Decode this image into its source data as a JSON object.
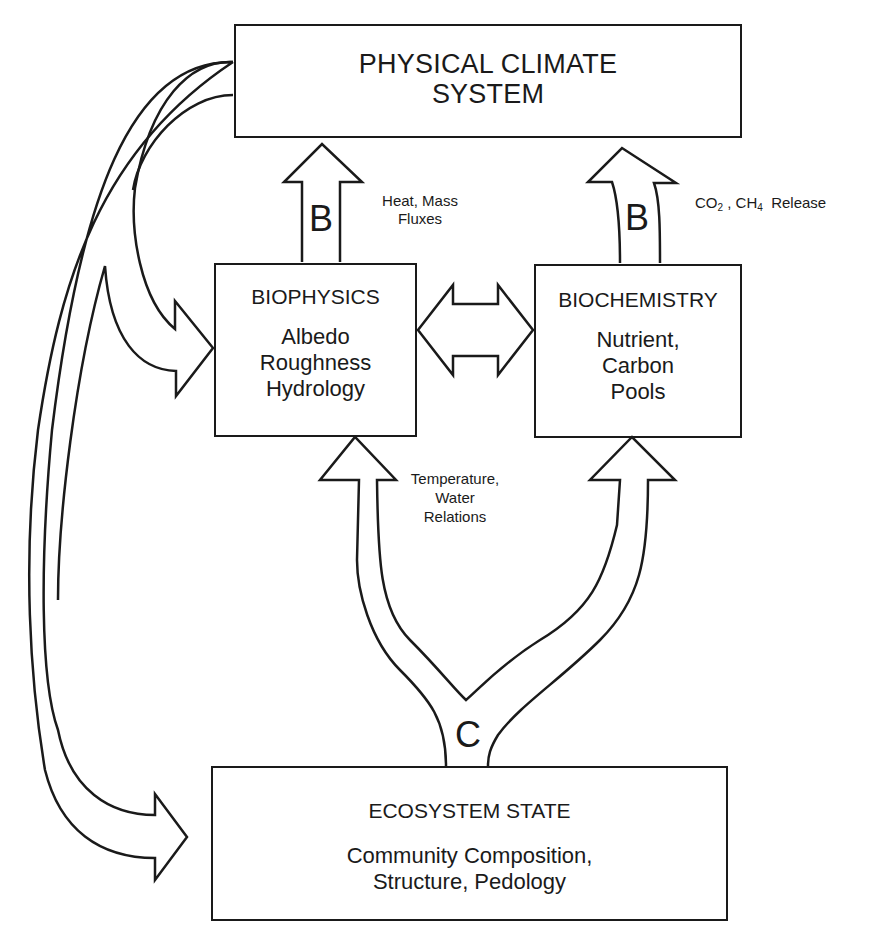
{
  "diagram": {
    "boxes": {
      "physical_climate": {
        "title_line1": "PHYSICAL CLIMATE",
        "title_line2": "SYSTEM"
      },
      "biophysics": {
        "title": "BIOPHYSICS",
        "items": [
          "Albedo",
          "Roughness",
          "Hydrology"
        ]
      },
      "biochemistry": {
        "title": "BIOCHEMISTRY",
        "items": [
          "Nutrient,",
          "Carbon",
          "Pools"
        ]
      },
      "ecosystem_state": {
        "title": "ECOSYSTEM STATE",
        "lines": [
          "Community Composition,",
          "Structure, Pedology"
        ]
      }
    },
    "arrows": {
      "biophysics_to_climate": {
        "letter": "B",
        "label_line1": "Heat, Mass",
        "label_line2": "Fluxes"
      },
      "biochemistry_to_climate": {
        "letter": "B",
        "label_co2": "CO",
        "label_co2_sub": "2",
        "label_sep": " , ",
        "label_ch4": "CH",
        "label_ch4_sub": "4",
        "label_release": "Release"
      },
      "ecosystem_to_bio": {
        "letter": "C",
        "label_line1": "Temperature,",
        "label_line2": "Water",
        "label_line3": "Relations"
      }
    },
    "colors": {
      "line": "#1a1a1a",
      "background": "#ffffff"
    }
  }
}
